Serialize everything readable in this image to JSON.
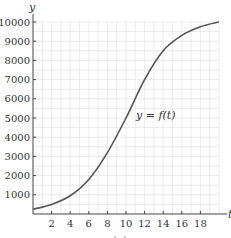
{
  "chart_data": {
    "type": "line",
    "title": "",
    "xlabel": "t",
    "ylabel": "y",
    "caption": "(a)",
    "curve_label": "y = f(t)",
    "xlim": [
      0,
      20
    ],
    "ylim": [
      0,
      10000
    ],
    "x_ticks": [
      2,
      4,
      6,
      8,
      10,
      12,
      14,
      16,
      18
    ],
    "y_ticks": [
      1000,
      2000,
      3000,
      4000,
      5000,
      6000,
      7000,
      8000,
      9000,
      10000
    ],
    "grid": true,
    "grid_minor_x_step": 1,
    "grid_minor_y_step": 500,
    "series": [
      {
        "name": "y = f(t)",
        "x": [
          0,
          2,
          4,
          6,
          8,
          10,
          12,
          14,
          16,
          18,
          20
        ],
        "values": [
          250,
          500,
          950,
          1800,
          3200,
          5000,
          7000,
          8500,
          9300,
          9750,
          10000
        ]
      }
    ],
    "colors": {
      "curve": "#555555",
      "axis": "#444444",
      "grid": "#dddddd",
      "text": "#333333"
    }
  }
}
